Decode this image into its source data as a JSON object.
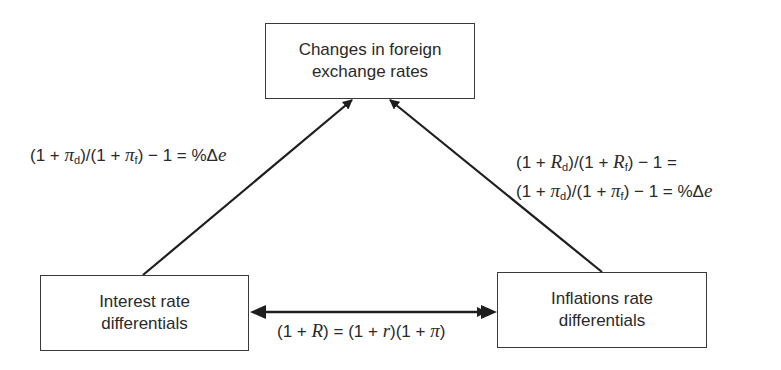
{
  "diagram": {
    "nodes": {
      "top": {
        "line1": "Changes in foreign",
        "line2": "exchange rates"
      },
      "left": {
        "line1": "Interest rate",
        "line2": "differentials"
      },
      "right": {
        "line1": "Inflations rate",
        "line2": "differentials"
      }
    },
    "edges": [
      {
        "from": "left",
        "to": "top",
        "label": "(1 + πd)/(1 + πf) − 1 = %Δe"
      },
      {
        "from": "right",
        "to": "top",
        "label": "(1 + Rd)/(1 + Rf) − 1 = (1 + πd)/(1 + πf) − 1 = %Δe"
      },
      {
        "from": "left",
        "to": "right",
        "bidirectional": true,
        "label": "(1 + R) = (1 + r)(1 + π)"
      }
    ],
    "formulas": {
      "left": {
        "p1": "(1 + ",
        "sym1": "π",
        "sub1": "d",
        "p2": ")/(1 + ",
        "sym2": "π",
        "sub2": "f",
        "p3": ") − 1 = %Δ",
        "e": "e"
      },
      "right_line1": {
        "p1": "(1 + ",
        "sym1": "R",
        "sub1": "d",
        "p2": ")/(1 + ",
        "sym2": "R",
        "sub2": "f",
        "p3": ") − 1 ="
      },
      "right_line2": {
        "p1": "(1 + ",
        "sym1": "π",
        "sub1": "d",
        "p2": ")/(1 +  ",
        "sym2": "π",
        "sub2": "f",
        "p3": ") − 1 = %Δ",
        "e": "e"
      },
      "bottom": {
        "p1": "(1 + ",
        "R": "R",
        "p2": ") = (1 + ",
        "r": "r",
        "p3": ")(1 + ",
        "pi": "π",
        "p4": ")"
      }
    },
    "colors": {
      "line": "#1e1e1e",
      "text": "#2a2a2a",
      "border": "#3a3a3a"
    }
  }
}
